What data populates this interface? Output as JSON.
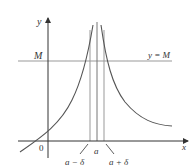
{
  "figure": {
    "type": "infinite-limit-graph",
    "labels": {
      "y_axis": "y",
      "x_axis": "x",
      "origin": "0",
      "M": "M",
      "line_label": "y = M",
      "a": "a",
      "a_minus_delta": "a − δ",
      "a_plus_delta": "a + δ"
    },
    "colors": {
      "axes": "#333333",
      "curve": "#555555",
      "guide_lines": "#999999",
      "text": "#333333"
    }
  }
}
